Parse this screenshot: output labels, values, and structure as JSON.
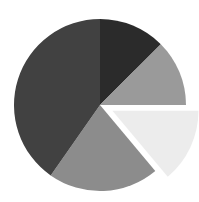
{
  "chart_data": {
    "type": "pie",
    "title": "",
    "subtitle": "",
    "xlabel": "",
    "ylabel": "",
    "grid": false,
    "legend": "none",
    "labels_shown": false,
    "start_angle_deg": 0,
    "direction": "clockwise",
    "center": {
      "x": 100,
      "y": 105
    },
    "radius": 86,
    "categories": [
      "Slice 1",
      "Slice 2",
      "Slice 3",
      "Slice 4",
      "Slice 5"
    ],
    "values": [
      12.5,
      12.5,
      14.0,
      21.0,
      40.0
    ],
    "units": "percent",
    "colors": [
      "#2b2b2b",
      "#9a9a9a",
      "#ececec",
      "#8c8c8c",
      "#414141"
    ],
    "explode": [
      0,
      0,
      0.16,
      0,
      0
    ],
    "slices": [
      {
        "name": "Slice 1",
        "value": 12.5,
        "color": "#2b2b2b",
        "start_angle_deg": 0,
        "end_angle_deg": 45,
        "exploded": false,
        "explode_offset": 0
      },
      {
        "name": "Slice 2",
        "value": 12.5,
        "color": "#9a9a9a",
        "start_angle_deg": 45,
        "end_angle_deg": 90,
        "exploded": false,
        "explode_offset": 0
      },
      {
        "name": "Slice 3",
        "value": 14.0,
        "color": "#ececec",
        "start_angle_deg": 90,
        "end_angle_deg": 140,
        "exploded": true,
        "explode_offset": 0.16
      },
      {
        "name": "Slice 4",
        "value": 21.0,
        "color": "#8c8c8c",
        "start_angle_deg": 140,
        "end_angle_deg": 215,
        "exploded": false,
        "explode_offset": 0
      },
      {
        "name": "Slice 5",
        "value": 40.0,
        "color": "#414141",
        "start_angle_deg": 215,
        "end_angle_deg": 360,
        "exploded": false,
        "explode_offset": 0
      }
    ],
    "background_color": "#ffffff"
  }
}
